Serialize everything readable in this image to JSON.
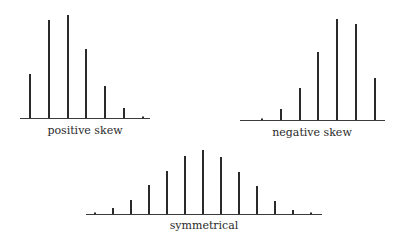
{
  "chart_data": [
    {
      "type": "bar",
      "title": "positive skew",
      "categories": [
        "1",
        "2",
        "3",
        "4",
        "5",
        "6",
        "7"
      ],
      "values": [
        44,
        98,
        103,
        69,
        32,
        10,
        0
      ],
      "xlabel": "",
      "ylabel": "",
      "grid": false,
      "layout": {
        "baseline_y": 118,
        "x_start": 30,
        "x_step": 18.8,
        "axis_from": 20,
        "axis_to": 150,
        "caption_x": 85,
        "caption_y": 124
      }
    },
    {
      "type": "bar",
      "title": "negative skew",
      "categories": [
        "1",
        "2",
        "3",
        "4",
        "5",
        "6",
        "7"
      ],
      "values": [
        0,
        11,
        32,
        68,
        101,
        96,
        42
      ],
      "xlabel": "",
      "ylabel": "",
      "grid": false,
      "layout": {
        "baseline_y": 120,
        "x_start": 262,
        "x_step": 18.8,
        "axis_from": 240,
        "axis_to": 385,
        "caption_x": 312,
        "caption_y": 126
      }
    },
    {
      "type": "bar",
      "title": "symmetrical",
      "categories": [
        "1",
        "2",
        "3",
        "4",
        "5",
        "6",
        "7",
        "8",
        "9",
        "10",
        "11",
        "12",
        "13"
      ],
      "values": [
        0,
        6,
        14,
        29,
        43,
        58,
        64,
        57,
        42,
        28,
        13,
        4,
        0
      ],
      "xlabel": "",
      "ylabel": "",
      "grid": false,
      "layout": {
        "baseline_y": 214,
        "x_start": 95,
        "x_step": 18,
        "axis_from": 86,
        "axis_to": 322,
        "caption_x": 204,
        "caption_y": 219
      }
    }
  ],
  "captions": {
    "positive": "positive skew",
    "negative": "negative skew",
    "symmetrical": "symmetrical"
  }
}
